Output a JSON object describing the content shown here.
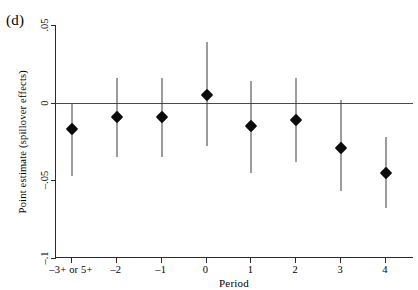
{
  "panel": {
    "label": "(d)"
  },
  "chart_data": {
    "type": "scatter",
    "title": "",
    "subtitle": "",
    "xlabel": "Period",
    "ylabel": "Point estimate (spillover effects)",
    "panel_label": "(d)",
    "categories": [
      "–3+ or 5+",
      "–2",
      "–1",
      "0",
      "1",
      "2",
      "3",
      "4"
    ],
    "x_tick_labels": [
      "–3+ or 5+",
      "–2",
      "–1",
      "0",
      "1",
      "2",
      "3",
      "4"
    ],
    "y_tick_labels": [
      ".05",
      "0",
      "–.05",
      "–.1"
    ],
    "y_tick_values": [
      0.05,
      0,
      -0.05,
      -0.1
    ],
    "ylim": [
      -0.1,
      0.05
    ],
    "xlim": [
      -0.5,
      7.5
    ],
    "grid": false,
    "legend": null,
    "zero_reference_line": 0,
    "marker_style": "filled-diamond",
    "error_bar_style": "vertical-line-no-caps",
    "values": [
      -0.017,
      -0.009,
      -0.009,
      0.005,
      -0.015,
      -0.011,
      -0.029,
      -0.045
    ],
    "ci_low": [
      -0.047,
      -0.035,
      -0.035,
      -0.028,
      -0.045,
      -0.038,
      -0.057,
      -0.068
    ],
    "ci_high": [
      0.0,
      0.016,
      0.016,
      0.039,
      0.014,
      0.016,
      0.002,
      -0.022
    ],
    "points": [
      {
        "x_label": "–3+ or 5+",
        "estimate": -0.017,
        "ci_low": -0.047,
        "ci_high": 0.0
      },
      {
        "x_label": "–2",
        "estimate": -0.009,
        "ci_low": -0.035,
        "ci_high": 0.016
      },
      {
        "x_label": "–1",
        "estimate": -0.009,
        "ci_low": -0.035,
        "ci_high": 0.016
      },
      {
        "x_label": "0",
        "estimate": 0.005,
        "ci_low": -0.028,
        "ci_high": 0.039
      },
      {
        "x_label": "1",
        "estimate": -0.015,
        "ci_low": -0.045,
        "ci_high": 0.014
      },
      {
        "x_label": "2",
        "estimate": -0.011,
        "ci_low": -0.038,
        "ci_high": 0.016
      },
      {
        "x_label": "3",
        "estimate": -0.029,
        "ci_low": -0.057,
        "ci_high": 0.002
      },
      {
        "x_label": "4",
        "estimate": -0.045,
        "ci_low": -0.068,
        "ci_high": -0.022
      }
    ],
    "colors": {
      "marker": "#0b0b0b",
      "error_bar": "#3a3a3a",
      "axis": "#2b2b2b",
      "zero_line": "#4a4a4a",
      "background": "#ffffff"
    }
  }
}
